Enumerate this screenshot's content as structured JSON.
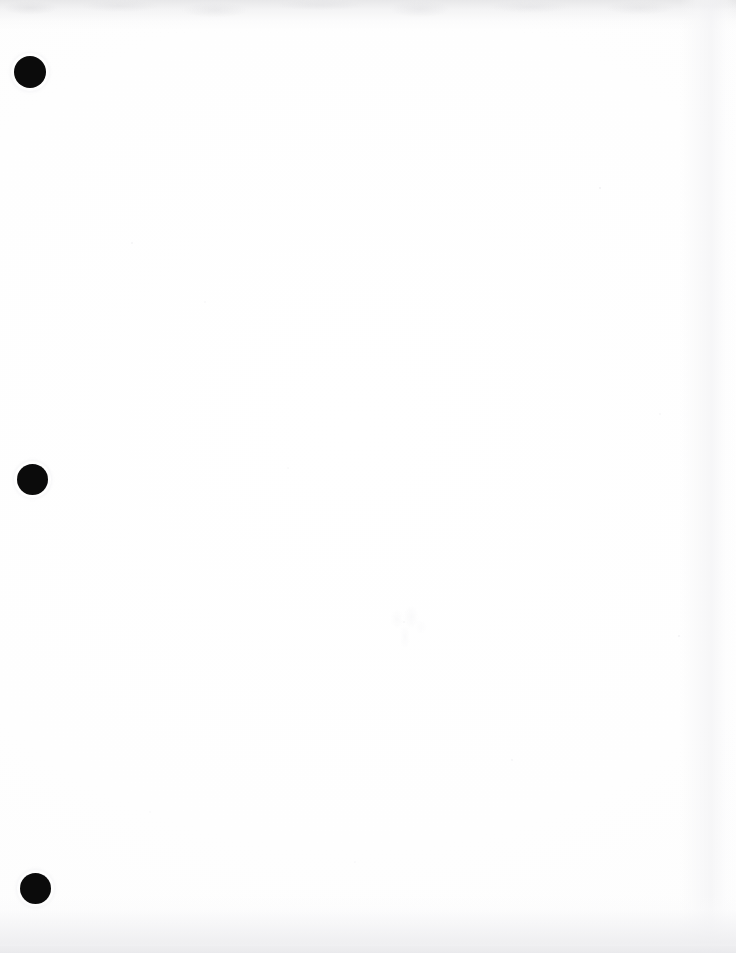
{
  "document": {
    "page_kind": "scanned-blank-page",
    "page_label": "",
    "visible_text": "",
    "body_text": "",
    "page_width": 736,
    "page_height": 953
  },
  "colors": {
    "paper": "#ffffff",
    "paper_tint": "#fdfdfd",
    "punch_hole": "#0b0b0b",
    "top_haze": "#dedee0",
    "bottom_wash": "#eeeef0",
    "speck": "#e9e9ec"
  },
  "punch_holes": [
    {
      "name": "top-hole-punch",
      "cx": 30,
      "cy": 72,
      "r": 16
    },
    {
      "name": "middle-hole-punch",
      "cx": 32,
      "cy": 479,
      "r": 15.5
    },
    {
      "name": "bottom-hole-punch",
      "cx": 35,
      "cy": 888,
      "r": 15.5
    }
  ],
  "artifacts": {
    "top_haze_label": "",
    "bottom_wash_label": "",
    "right_band_label": "",
    "ghost_smudge_label": ""
  }
}
